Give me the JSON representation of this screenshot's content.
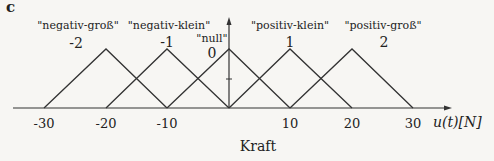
{
  "panel_label": "c",
  "sets": [
    {
      "name": "\"negativ-groß\"",
      "value": "-2",
      "peak": -20
    },
    {
      "name": "\"negativ-klein\"",
      "value": "-1",
      "peak": -10
    },
    {
      "name": "\"null\"",
      "value": "0",
      "peak": 0
    },
    {
      "name": "\"positiv-klein\"",
      "value": "1",
      "peak": 10
    },
    {
      "name": "\"positiv-groß\"",
      "value": "2",
      "peak": 20
    }
  ],
  "ticks": [
    "-30",
    "-20",
    "-10",
    "10",
    "20",
    "30"
  ],
  "axis_label": "u(t)[N]",
  "x_title": "Kraft",
  "line_color": "#333333"
}
